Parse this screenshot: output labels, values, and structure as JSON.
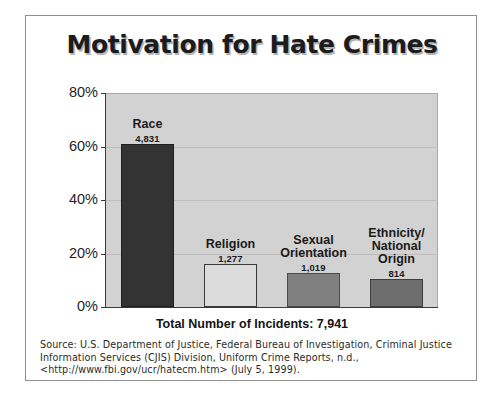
{
  "figure": {
    "title": "Motivation for Hate Crimes",
    "total_line": "Total Number of Incidents: 7,941",
    "source_note": "Source: U.S. Department of Justice, Federal Bureau of Investigation, Criminal Justice Information Services (CJIS) Division, Uniform Crime Reports, n.d., <http://www.fbi.gov/ucr/hatecm.htm> (July 5, 1999)."
  },
  "chart_data": {
    "type": "bar",
    "title": "Motivation for Hate Crimes",
    "xlabel": "",
    "ylabel": "",
    "ylim": [
      0,
      80
    ],
    "ytick_labels": [
      "0%",
      "20%",
      "40%",
      "60%",
      "80%"
    ],
    "ytick_values": [
      0,
      20,
      40,
      60,
      80
    ],
    "grid": true,
    "legend": "none",
    "categories": [
      "Race",
      "Religion",
      "Sexual Orientation",
      "Ethnicity/ National Origin"
    ],
    "counts": [
      4831,
      1277,
      1019,
      814
    ],
    "count_labels": [
      "4,831",
      "1,277",
      "1,019",
      "814"
    ],
    "values": [
      60.8,
      16.1,
      12.8,
      10.3
    ],
    "total": 7941,
    "bar_colors": [
      "#333333",
      "#dcdcdc",
      "#808080",
      "#6e6e6e"
    ],
    "plot_background": "#d2d2d2",
    "annotations": [
      "Total Number of Incidents: 7,941"
    ]
  },
  "bars": [
    {
      "label_line1": "Race",
      "label_line2": "",
      "label_line3": "",
      "count": "4,831",
      "percent": 60.8,
      "color": "#333333",
      "border": "#1f1f1f"
    },
    {
      "label_line1": "Religion",
      "label_line2": "",
      "label_line3": "",
      "count": "1,277",
      "percent": 16.1,
      "color": "#dcdcdc",
      "border": "#3a3a3a"
    },
    {
      "label_line1": "Sexual",
      "label_line2": "Orientation",
      "label_line3": "",
      "count": "1,019",
      "percent": 12.8,
      "color": "#808080",
      "border": "#4a4a4a"
    },
    {
      "label_line1": "Ethnicity/",
      "label_line2": "National",
      "label_line3": "Origin",
      "count": "814",
      "percent": 10.3,
      "color": "#6e6e6e",
      "border": "#3f3f3f"
    }
  ],
  "yaxis": {
    "ticks": [
      {
        "label": "80%",
        "value": 80
      },
      {
        "label": "60%",
        "value": 60
      },
      {
        "label": "40%",
        "value": 40
      },
      {
        "label": "20%",
        "value": 20
      },
      {
        "label": "0%",
        "value": 0
      }
    ]
  }
}
